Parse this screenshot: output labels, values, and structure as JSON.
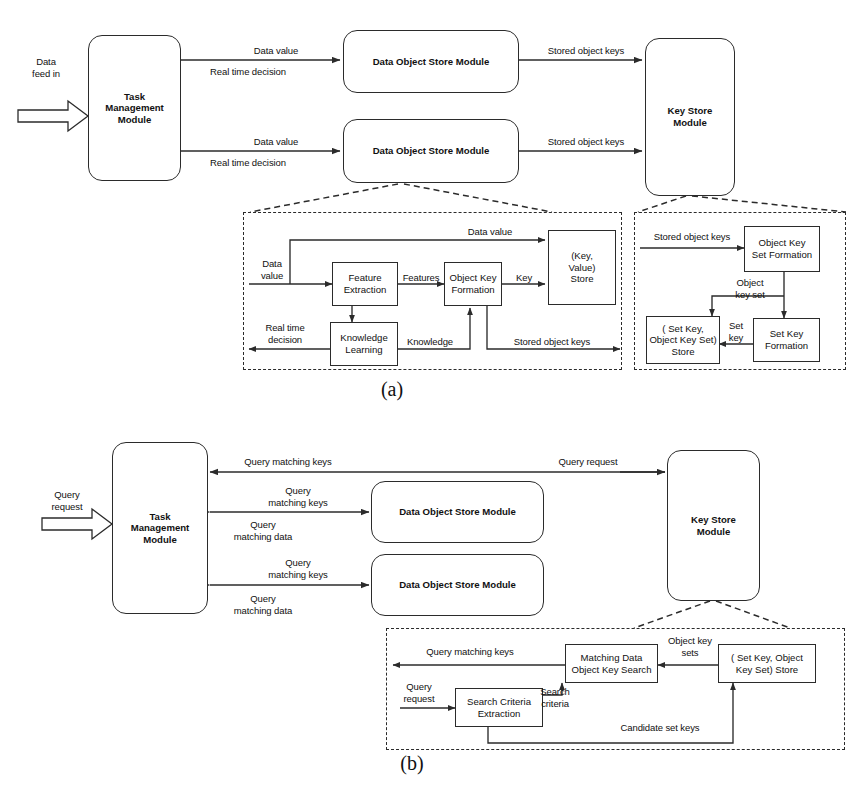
{
  "figure": {
    "caption_a": "(a)",
    "caption_b": "(b)",
    "stroke_color": "#2b2b2b",
    "text_color": "#111111",
    "background": "#ffffff"
  },
  "diagram_a": {
    "nodes": {
      "task_management": "Task\nManagement\nModule",
      "data_object_store_1": "Data Object Store Module",
      "data_object_store_2": "Data Object Store Module",
      "key_store": "Key Store\nModule",
      "feature_extraction": "Feature\nExtraction",
      "knowledge_learning": "Knowledge\nLearning",
      "object_key_formation": "Object Key\nFormation",
      "key_value_store": "(Key,\nValue)\nStore",
      "object_key_set_formation": "Object Key\nSet Formation",
      "set_key_formation": "Set Key\nFormation",
      "set_key_object_key_set_store": "( Set Key,\nObject Key Set)\nStore"
    },
    "edge_labels": {
      "data_feed_in": "Data\nfeed in",
      "data_value_top": "Data value",
      "real_time_decision_top": "Real time decision",
      "data_value_bottom": "Data value",
      "real_time_decision_bottom": "Real time decision",
      "stored_object_keys_top": "Stored object keys",
      "stored_object_keys_bottom": "Stored object keys",
      "inner_data_value_in": "Data\nvalue",
      "inner_data_value_bypass": "Data value",
      "inner_features": "Features",
      "inner_key": "Key",
      "inner_knowledge": "Knowledge",
      "inner_real_time_decision": "Real time\ndecision",
      "inner_stored_object_keys_out": "Stored object keys",
      "ks_stored_object_keys_in": "Stored object keys",
      "ks_object_key_set": "Object\nkey set",
      "ks_set_key": "Set\nkey"
    }
  },
  "diagram_b": {
    "nodes": {
      "task_management": "Task\nManagement\nModule",
      "data_object_store_1": "Data Object Store Module",
      "data_object_store_2": "Data Object Store Module",
      "key_store": "Key Store\nModule",
      "matching_data_object_key_search": "Matching Data\nObject Key Search",
      "search_criteria_extraction": "Search Criteria\nExtraction",
      "set_key_object_key_set_store": "( Set Key, Object\nKey Set) Store"
    },
    "edge_labels": {
      "query_request_in": "Query\nrequest",
      "query_matching_keys_top": "Query matching keys",
      "query_request_top_right": "Query request",
      "query_matching_keys_1": "Query\nmatching keys",
      "query_matching_data_1": "Query\nmatching data",
      "query_matching_keys_2": "Query\nmatching keys",
      "query_matching_data_2": "Query\nmatching data",
      "inner_query_matching_keys": "Query matching keys",
      "inner_object_key_sets": "Object key\nsets",
      "inner_query_request": "Query\nrequest",
      "inner_search_criteria": "Search\ncriteria",
      "inner_candidate_set_keys": "Candidate set keys"
    }
  }
}
